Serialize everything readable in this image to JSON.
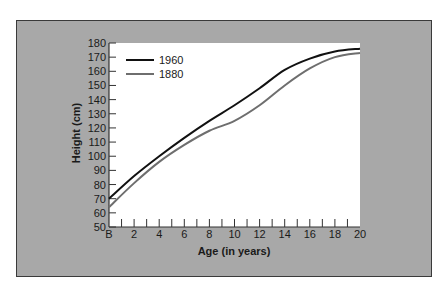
{
  "chart_data": {
    "type": "line",
    "title": "",
    "xlabel": "Age (in years)",
    "ylabel": "Height (cm)",
    "x": [
      0,
      2,
      4,
      6,
      8,
      10,
      12,
      14,
      16,
      18,
      20
    ],
    "x_tick_labels": [
      "B",
      "2",
      "4",
      "6",
      "8",
      "10",
      "12",
      "14",
      "16",
      "18",
      "20"
    ],
    "y_ticks": [
      50,
      60,
      70,
      80,
      90,
      100,
      110,
      120,
      130,
      140,
      150,
      160,
      170,
      180
    ],
    "xlim": [
      0,
      20
    ],
    "ylim": [
      50,
      180
    ],
    "grid": false,
    "legend_position": "upper-left",
    "series": [
      {
        "name": "1960",
        "color": "#111111",
        "values": [
          70,
          86,
          100,
          113,
          125,
          136,
          148,
          161,
          169,
          174,
          176
        ]
      },
      {
        "name": "1880",
        "color": "#6e6e6e",
        "values": [
          64,
          81,
          96,
          108,
          118,
          125,
          136,
          150,
          162,
          170,
          173
        ]
      }
    ]
  },
  "colors": {
    "panel_background": "#a8a8a8",
    "panel_border": "#3a3a3a",
    "plot_background": "#ffffff"
  }
}
